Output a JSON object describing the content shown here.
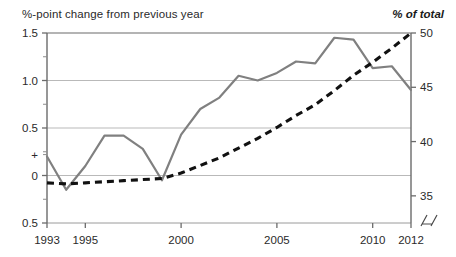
{
  "header": {
    "left_label": "%-point change from previous year",
    "right_label": "% of total"
  },
  "chart_data": {
    "type": "line",
    "title": "",
    "xlabel": "",
    "grid": true,
    "legend": "none",
    "x": [
      1993,
      1994,
      1995,
      1996,
      1997,
      1998,
      1999,
      2000,
      2001,
      2002,
      2003,
      2004,
      2005,
      2006,
      2007,
      2008,
      2009,
      2010,
      2011,
      2012
    ],
    "xlim": [
      1993,
      2012
    ],
    "xticks": [
      1993,
      1995,
      2000,
      2005,
      2010,
      2012
    ],
    "xticklabels": [
      "1993",
      "1995",
      "2000",
      "2005",
      "2010",
      "2012"
    ],
    "left_axis": {
      "label": "%-point change from previous year",
      "ylim": [
        -0.5,
        1.5
      ],
      "yticks": [
        -0.5,
        0,
        0.5,
        1.0,
        1.5
      ],
      "yticklabels": [
        "0.5",
        "0",
        "0.5",
        "1.0",
        "1.5"
      ],
      "zero_marker": "+",
      "minor_ticks": [
        -0.25,
        0.25,
        0.75,
        1.25
      ]
    },
    "right_axis": {
      "label": "% of total",
      "ylim": [
        32.5,
        50
      ],
      "yticks": [
        35,
        40,
        45,
        50
      ],
      "yticklabels": [
        "35",
        "40",
        "45",
        "50"
      ],
      "axis_break": true
    },
    "series": [
      {
        "name": "%-point change from previous year",
        "axis": "left",
        "style": "solid",
        "color": "#808080",
        "values": [
          0.2,
          -0.15,
          0.1,
          0.42,
          0.42,
          0.28,
          -0.05,
          0.43,
          0.7,
          0.82,
          1.05,
          1.0,
          1.08,
          1.2,
          1.18,
          1.45,
          1.43,
          1.13,
          1.15,
          0.9
        ]
      },
      {
        "name": "% of total",
        "axis": "right",
        "style": "dashed",
        "color": "#111111",
        "values": [
          36.2,
          36.1,
          36.2,
          36.3,
          36.4,
          36.5,
          36.6,
          37.1,
          37.8,
          38.5,
          39.4,
          40.3,
          41.3,
          42.4,
          43.4,
          44.7,
          46.1,
          47.3,
          48.6,
          50.0
        ]
      }
    ]
  }
}
